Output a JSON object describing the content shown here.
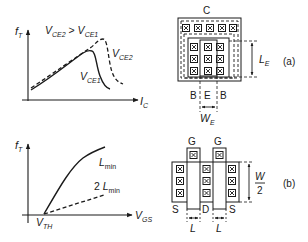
{
  "figure": {
    "top_left_plot": {
      "y_axis_label": "f",
      "y_axis_sub": "T",
      "x_axis_label": "I",
      "x_axis_sub": "C",
      "condition": {
        "a": "V",
        "a_sub": "CE2",
        "op": " > ",
        "b": "V",
        "b_sub": "CE1"
      },
      "curves": [
        {
          "label": "V",
          "sub": "CE2",
          "style": "dashed"
        },
        {
          "label": "V",
          "sub": "CE1",
          "style": "solid"
        }
      ]
    },
    "bottom_left_plot": {
      "y_axis_label": "f",
      "y_axis_sub": "T",
      "x_axis_label": "V",
      "x_axis_sub": "GS",
      "origin_label": "V",
      "origin_sub": "TH",
      "curves": [
        {
          "label": "L",
          "sub": "min",
          "prefix": "",
          "style": "solid"
        },
        {
          "label": "L",
          "sub": "min",
          "prefix": "2 ",
          "style": "dashed"
        }
      ]
    },
    "layout_a": {
      "tag": "(a)",
      "collector_label": "C",
      "bottom_labels": [
        "B",
        "E",
        "B"
      ],
      "width_label": "W",
      "width_sub": "E",
      "length_label": "L",
      "length_sub": "E"
    },
    "layout_b": {
      "tag": "(b)",
      "gate_labels": [
        "G",
        "G"
      ],
      "bottom_labels": [
        "S",
        "D",
        "S"
      ],
      "width_num": "W",
      "width_den": "2",
      "length_labels": [
        "L",
        "L"
      ]
    }
  },
  "colors": {
    "ink": "#1a1a1a",
    "background": "#ffffff"
  }
}
